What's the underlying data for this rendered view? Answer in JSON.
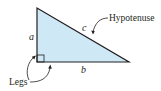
{
  "diagram": {
    "colors": {
      "fill": "#cfe8f5",
      "stroke": "#231f20"
    },
    "side_labels": {
      "a": "a",
      "b": "b",
      "c": "c"
    },
    "callouts": {
      "hypotenuse": "Hypotenuse",
      "legs": "Legs"
    }
  }
}
